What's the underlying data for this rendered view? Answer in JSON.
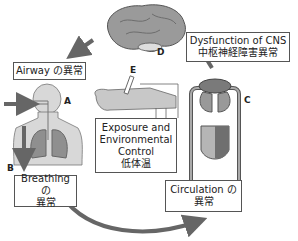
{
  "boxes": {
    "airway": {
      "line1": "Airway の異常"
    },
    "cns": {
      "line1": "Dysfunction of CNS",
      "line2": "中枢神経障害異常"
    },
    "exposure": {
      "line1": "Exposure and",
      "line2": "Environmental",
      "line3": "Control",
      "line4": "低体温"
    },
    "breathing": {
      "line1": "Breathing の",
      "line2": "異常"
    },
    "circulation": {
      "line1": "Circulation の",
      "line2": "異常"
    }
  },
  "labels": {
    "a": "A",
    "b": "B",
    "c": "C",
    "d": "D",
    "e": "E"
  },
  "colors": {
    "arrow": "#666666",
    "organ_fill": "#9a9a9a",
    "line": "#555555"
  }
}
